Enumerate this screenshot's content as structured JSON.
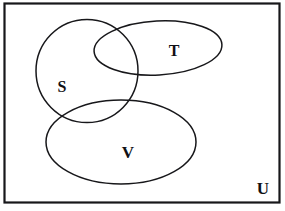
{
  "figure": {
    "type": "venn-diagram",
    "background_color": "#ffffff",
    "stroke_color": "#17171a",
    "text_color": "#101014"
  },
  "universe": {
    "label": "U",
    "label_x": 263,
    "label_y": 194,
    "font_size": 17,
    "rect": {
      "x": 4.5,
      "y": 3.5,
      "width": 275,
      "height": 199,
      "stroke_width": 2.2
    }
  },
  "sets": [
    {
      "id": "S",
      "label": "S",
      "shape": "ellipse",
      "cx": 87,
      "cy": 71,
      "rx": 51,
      "ry": 51.5,
      "rotation": 0,
      "stroke_width": 1.5,
      "label_x": 62,
      "label_y": 92,
      "font_size": 16
    },
    {
      "id": "T",
      "label": "T",
      "shape": "ellipse",
      "cx": 158,
      "cy": 48,
      "rx": 64,
      "ry": 27,
      "rotation": -3,
      "stroke_width": 1.5,
      "label_x": 174,
      "label_y": 56,
      "font_size": 16
    },
    {
      "id": "V",
      "label": "V",
      "shape": "ellipse",
      "cx": 121,
      "cy": 142,
      "rx": 75,
      "ry": 42,
      "rotation": 0,
      "stroke_width": 1.5,
      "label_x": 128,
      "label_y": 158,
      "font_size": 17
    }
  ],
  "relations": {
    "S_intersect_T": true,
    "S_intersect_V": true,
    "T_intersect_V": false,
    "S_intersect_T_intersect_V": false
  }
}
